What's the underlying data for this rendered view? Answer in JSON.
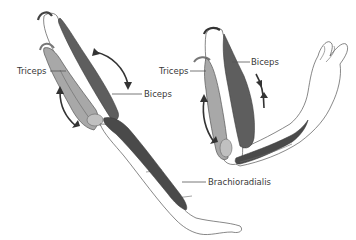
{
  "diagram": {
    "colors": {
      "triceps": "#a8a8a8",
      "biceps": "#5e5e5e",
      "brachioradialis": "#4a4a4a",
      "bone_outline": "#555555",
      "arrow": "#333333",
      "label_text": "#3a3a3a",
      "background": "#ffffff"
    },
    "panels": [
      {
        "name": "arm-extended",
        "labels": {
          "triceps": "Triceps",
          "biceps": "Biceps",
          "brachioradialis": "Brachioradialis"
        }
      },
      {
        "name": "arm-flexed",
        "labels": {
          "triceps": "Triceps",
          "biceps": "Biceps"
        }
      }
    ]
  }
}
